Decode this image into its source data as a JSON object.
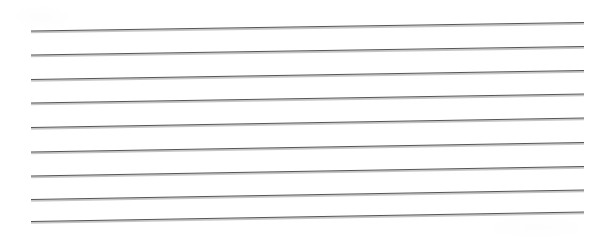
{
  "document": {
    "kind": "scanned-lined-paper",
    "page_width": 601,
    "page_height": 244,
    "background_color": "#ffffff",
    "text_content": "",
    "handwriting_present": "no",
    "orientation": "landscape"
  },
  "rules": {
    "count": 9,
    "line_color": "#565656",
    "line_shadow_color": "#b9b9b9",
    "line_thickness_px": 1,
    "shadow_thickness_px": 2,
    "start_x": 31,
    "end_x": 584,
    "skew_note": "lines rise slightly toward the right (scan skew)",
    "lines": [
      {
        "index": 1,
        "y_left": 31.0,
        "y_right": 22.5
      },
      {
        "index": 2,
        "y_left": 55.0,
        "y_right": 46.5
      },
      {
        "index": 3,
        "y_left": 79.5,
        "y_right": 70.5
      },
      {
        "index": 4,
        "y_left": 103.0,
        "y_right": 94.0
      },
      {
        "index": 5,
        "y_left": 127.5,
        "y_right": 118.0
      },
      {
        "index": 6,
        "y_left": 152.0,
        "y_right": 142.5
      },
      {
        "index": 7,
        "y_left": 176.0,
        "y_right": 166.5
      },
      {
        "index": 8,
        "y_left": 199.5,
        "y_right": 190.0
      },
      {
        "index": 9,
        "y_left": 221.5,
        "y_right": 212.0
      }
    ]
  }
}
